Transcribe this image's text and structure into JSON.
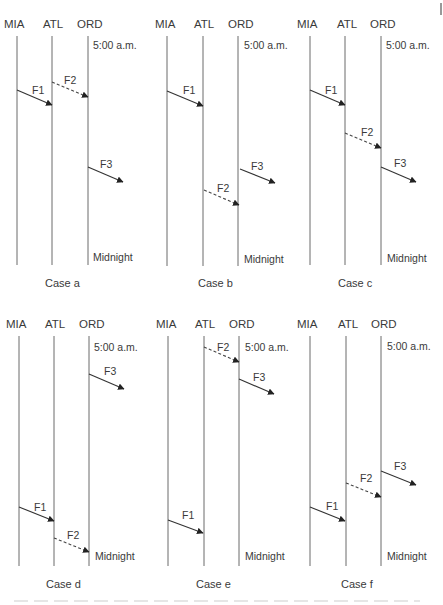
{
  "diagram": {
    "stations": [
      "MIA",
      "ATL",
      "ORD"
    ],
    "start_time_label": "5:00 a.m.",
    "end_time_label": "Midnight",
    "colors": {
      "line": "#6a6a6a",
      "text": "#3a3a3a",
      "arrow": "#333333"
    },
    "cases": [
      {
        "id": "a",
        "label": "Case a",
        "flights": [
          {
            "name": "F1",
            "from": "MIA",
            "to": "ATL",
            "style": "solid"
          },
          {
            "name": "F2",
            "from": "ATL",
            "to": "ORD",
            "style": "dashed"
          },
          {
            "name": "F3",
            "from": "ORD",
            "to": "",
            "style": "solid"
          }
        ]
      },
      {
        "id": "b",
        "label": "Case b",
        "flights": [
          {
            "name": "F1",
            "from": "MIA",
            "to": "ATL",
            "style": "solid"
          },
          {
            "name": "F3",
            "from": "ORD",
            "to": "",
            "style": "solid"
          },
          {
            "name": "F2",
            "from": "ATL",
            "to": "ORD",
            "style": "dashed"
          }
        ]
      },
      {
        "id": "c",
        "label": "Case c",
        "flights": [
          {
            "name": "F1",
            "from": "MIA",
            "to": "ATL",
            "style": "solid"
          },
          {
            "name": "F2",
            "from": "ATL",
            "to": "ORD",
            "style": "dashed"
          },
          {
            "name": "F3",
            "from": "ORD",
            "to": "",
            "style": "solid"
          }
        ]
      },
      {
        "id": "d",
        "label": "Case d",
        "flights": [
          {
            "name": "F3",
            "from": "ORD",
            "to": "",
            "style": "solid"
          },
          {
            "name": "F1",
            "from": "MIA",
            "to": "ATL",
            "style": "solid"
          },
          {
            "name": "F2",
            "from": "ATL",
            "to": "ORD",
            "style": "dashed"
          }
        ]
      },
      {
        "id": "e",
        "label": "Case e",
        "flights": [
          {
            "name": "F2",
            "from": "ATL",
            "to": "ORD",
            "style": "dashed"
          },
          {
            "name": "F3",
            "from": "ORD",
            "to": "",
            "style": "solid"
          },
          {
            "name": "F1",
            "from": "MIA",
            "to": "ATL",
            "style": "solid"
          }
        ]
      },
      {
        "id": "f",
        "label": "Case f",
        "flights": [
          {
            "name": "F3",
            "from": "ORD",
            "to": "",
            "style": "solid"
          },
          {
            "name": "F2",
            "from": "ATL",
            "to": "ORD",
            "style": "dashed"
          },
          {
            "name": "F1",
            "from": "MIA",
            "to": "ATL",
            "style": "solid"
          }
        ]
      }
    ]
  }
}
